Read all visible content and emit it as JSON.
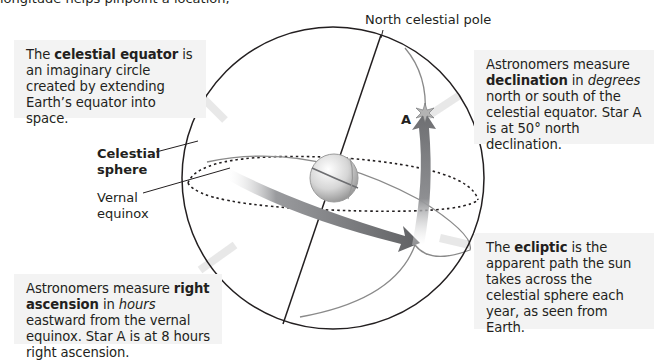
{
  "figure": {
    "cut_off_top_text": "longitude helps pinpoint a location,",
    "labels": {
      "north_pole": "North celestial pole",
      "celestial_sphere_line1": "Celestial",
      "celestial_sphere_line2": "sphere",
      "vernal_equinox_line1": "Vernal",
      "vernal_equinox_line2": "equinox",
      "star": "A"
    },
    "callouts": {
      "celestial_equator": {
        "pre": "The ",
        "term": "celestial equator",
        "post": " is an imaginary circle created by extending Earth’s equator into space."
      },
      "declination": {
        "pre": "Astronomers measure ",
        "term": "declination",
        "mid": " in ",
        "emph": "degrees",
        "post": " north or south of the celestial equator. Star A is at 50° north declination."
      },
      "right_ascension": {
        "pre": "Astronomers measure ",
        "term": "right ascension",
        "mid": " in ",
        "emph": "hours",
        "post": " eastward from the vernal equinox. Star A is at 8 hours right ascension."
      },
      "ecliptic": {
        "pre": "The ",
        "term": "ecliptic",
        "post": " is the apparent path the sun takes across the celestial sphere each year, as seen from Earth."
      }
    },
    "colors": {
      "callout_bg": "#f3f3f3",
      "line": "#231f20",
      "arrow": "#6d6e71",
      "ecliptic": "#8a8a8a"
    }
  }
}
